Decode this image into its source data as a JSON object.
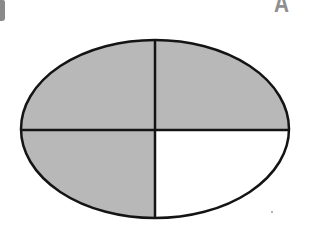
{
  "figure": {
    "type": "ellipse-fraction-model",
    "parts_total": 4,
    "parts_shaded": 3,
    "parts_unshaded": 1,
    "unshaded_position": "bottom-right",
    "colors": {
      "shaded": "#b8b8b8",
      "unshaded": "#ffffff",
      "outline": "#141414"
    },
    "quadrants": [
      {
        "position": "top-left",
        "shaded": true
      },
      {
        "position": "top-right",
        "shaded": true
      },
      {
        "position": "bottom-left",
        "shaded": true
      },
      {
        "position": "bottom-right",
        "shaded": false
      }
    ]
  },
  "fragments": {
    "top_right_letter": "A"
  }
}
